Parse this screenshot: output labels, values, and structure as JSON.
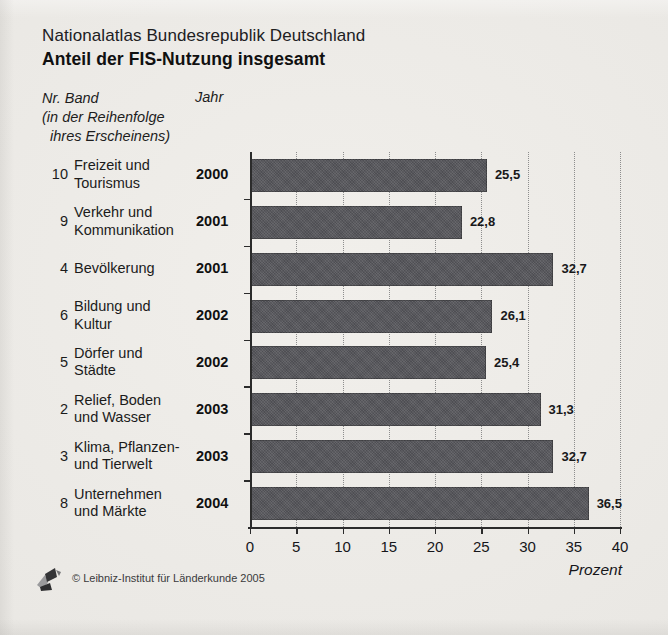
{
  "header": {
    "suptitle": "Nationalatlas Bundesrepublik Deutschland",
    "title": "Anteil der FIS-Nutzung insgesamt"
  },
  "columns": {
    "band_heading": "Nr. Band\n(in der Reihenfolge\n  ihres Erscheinens)",
    "year_heading": "Jahr"
  },
  "footer": {
    "copyright": "© Leibniz-Institut für Länderkunde 2005",
    "logo_name": "ifl-logo"
  },
  "colors": {
    "bar_fill": "#56565b",
    "axis": "#2b2b2b",
    "gridline": "#8d8d8d",
    "background": "#eae8e4",
    "text": "#1a1a1a"
  },
  "chart_data": {
    "type": "bar",
    "orientation": "horizontal",
    "title": "Anteil der FIS-Nutzung insgesamt",
    "subtitle": "Nationalatlas Bundesrepublik Deutschland",
    "xlabel": "Prozent",
    "ylabel": "",
    "xlim": [
      0,
      40
    ],
    "xticks": [
      0,
      5,
      10,
      15,
      20,
      25,
      30,
      35,
      40
    ],
    "xticklabels": [
      "0",
      "5",
      "10",
      "15",
      "20",
      "25",
      "30",
      "35",
      "40"
    ],
    "grid": "vertical-dotted",
    "legend": "none",
    "value_decimal_separator": ",",
    "categories": [
      "Freizeit und Tourismus",
      "Verkehr und Kommunikation",
      "Bevölkerung",
      "Bildung und Kultur",
      "Dörfer und Städte",
      "Relief, Boden und Wasser",
      "Klima, Pflanzen- und Tierwelt",
      "Unternehmen und Märkte"
    ],
    "values": [
      25.5,
      22.8,
      32.7,
      26.1,
      25.4,
      31.3,
      32.7,
      36.5
    ],
    "value_labels": [
      "25,5",
      "22,8",
      "32,7",
      "26,1",
      "25,4",
      "31,3",
      "32,7",
      "36,5"
    ],
    "rows": [
      {
        "num": "10",
        "name": "Freizeit und\nTourismus",
        "year": "2000",
        "value": 25.5,
        "value_label": "25,5"
      },
      {
        "num": "9",
        "name": "Verkehr und\nKommunikation",
        "year": "2001",
        "value": 22.8,
        "value_label": "22,8"
      },
      {
        "num": "4",
        "name": "Bevölkerung",
        "year": "2001",
        "value": 32.7,
        "value_label": "32,7"
      },
      {
        "num": "6",
        "name": "Bildung und\nKultur",
        "year": "2002",
        "value": 26.1,
        "value_label": "26,1"
      },
      {
        "num": "5",
        "name": "Dörfer und\nStädte",
        "year": "2002",
        "value": 25.4,
        "value_label": "25,4"
      },
      {
        "num": "2",
        "name": "Relief, Boden\nund Wasser",
        "year": "2003",
        "value": 31.3,
        "value_label": "31,3"
      },
      {
        "num": "3",
        "name": "Klima, Pflanzen-\nund Tierwelt",
        "year": "2003",
        "value": 32.7,
        "value_label": "32,7"
      },
      {
        "num": "8",
        "name": "Unternehmen\nund Märkte",
        "year": "2004",
        "value": 36.5,
        "value_label": "36,5"
      }
    ]
  }
}
